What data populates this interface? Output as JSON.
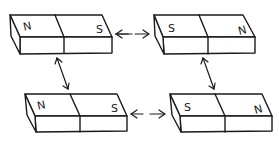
{
  "diagram": {
    "title": "",
    "colors": {
      "line": "#1a1a1a",
      "background": "#ffffff"
    },
    "magnets": [
      {
        "id": "top-left",
        "left_pole": "N",
        "right_pole": "S"
      },
      {
        "id": "top-right",
        "left_pole": "S",
        "right_pole": "N"
      },
      {
        "id": "bottom-left",
        "left_pole": "N",
        "right_pole": "S"
      },
      {
        "id": "bottom-right",
        "left_pole": "S",
        "right_pole": "N"
      }
    ],
    "arrows": [
      {
        "from": "top-left",
        "to": "top-right",
        "type": "double-headed",
        "style": "dashed"
      },
      {
        "from": "bottom-left",
        "to": "bottom-right",
        "type": "double-headed",
        "style": "dashed"
      },
      {
        "from": "top-left",
        "to": "bottom-left",
        "type": "double-headed",
        "style": "solid"
      },
      {
        "from": "top-right",
        "to": "bottom-right",
        "type": "double-headed",
        "style": "solid"
      }
    ]
  }
}
